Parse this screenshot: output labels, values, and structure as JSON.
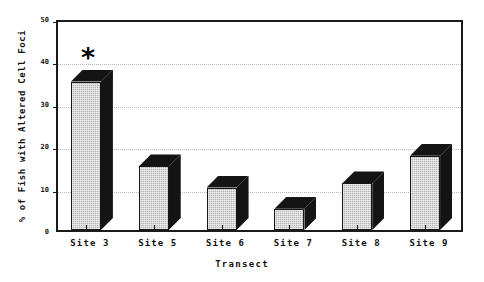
{
  "chart_data": {
    "type": "bar",
    "title": "",
    "subtitle": "",
    "categories": [
      "Site 3",
      "Site 5",
      "Site 6",
      "Site 7",
      "Site 8",
      "Site 9"
    ],
    "values": [
      35,
      15,
      10,
      5,
      11,
      17.5
    ],
    "xlabel": "Transect",
    "ylabel": "% of Fish with Altered Cell Foci",
    "ylim": [
      0,
      50
    ],
    "yticks": [
      0,
      10,
      20,
      30,
      40,
      50
    ],
    "ytick_labels": [
      "0",
      "10",
      "20",
      "30",
      "40",
      "50"
    ],
    "grid": true,
    "grid_axis": "y",
    "grid_style": "dotted",
    "legend": false,
    "legend_position": "none",
    "bar_style": "3d-shaded",
    "bar_face_color": "#b6b6b6",
    "bar_edge_color": "#141414",
    "annotations": [
      {
        "text": "*",
        "category": "Site 3",
        "value": 40,
        "meaning": "significance-marker"
      }
    ]
  },
  "axis": {
    "frame_color": "#1a1a1a",
    "background_color": "#ffffff"
  }
}
